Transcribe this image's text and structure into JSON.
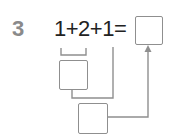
{
  "problem": {
    "number": "3",
    "equation": "1+2+1=",
    "terms": [
      "1",
      "2",
      "1"
    ],
    "operators": [
      "+",
      "+",
      "="
    ]
  },
  "boxes": {
    "answer": {
      "label": "answer-box",
      "value": ""
    },
    "step1": {
      "label": "step1-box",
      "value": ""
    },
    "step2": {
      "label": "step2-box",
      "value": ""
    }
  },
  "colors": {
    "number": "#8a8a8a",
    "equation": "#222222",
    "lines": "#8f8f8f"
  }
}
